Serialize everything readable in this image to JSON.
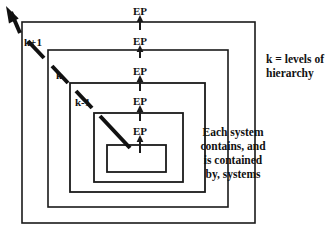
{
  "diagram": {
    "type": "nested-hierarchy-diagram",
    "canvas": {
      "width": 334,
      "height": 236,
      "background": "#ffffff"
    },
    "stroke_color": "#1a1a1a",
    "nested_rectangles": [
      {
        "level": "k+1",
        "x": 22,
        "y": 22,
        "width": 233,
        "height": 201,
        "stroke_width": 1.6
      },
      {
        "level": "k",
        "x": 48,
        "y": 50,
        "width": 180,
        "height": 157,
        "stroke_width": 1.6
      },
      {
        "level": "k-1",
        "x": 70,
        "y": 83,
        "width": 135,
        "height": 109,
        "stroke_width": 1.8
      },
      {
        "level": "",
        "x": 94,
        "y": 113,
        "width": 89,
        "height": 69,
        "stroke_width": 1.8
      },
      {
        "level": "",
        "x": 107,
        "y": 145,
        "width": 59,
        "height": 27,
        "stroke_width": 1.8
      }
    ],
    "ep_markers": [
      {
        "label": "EP",
        "x": 140,
        "y": 11,
        "arrow_from_y": 30,
        "arrow_to_y": 15
      },
      {
        "label": "EP",
        "x": 140,
        "y": 41,
        "arrow_from_y": 58,
        "arrow_to_y": 45
      },
      {
        "label": "EP",
        "x": 140,
        "y": 71,
        "arrow_from_y": 91,
        "arrow_to_y": 75
      },
      {
        "label": "EP",
        "x": 140,
        "y": 101,
        "arrow_from_y": 121,
        "arrow_to_y": 105
      },
      {
        "label": "EP",
        "x": 140,
        "y": 131,
        "arrow_from_y": 153,
        "arrow_to_y": 135
      }
    ],
    "diagonal_arrow": {
      "description": "dashed diagonal arrow pointing up-left through hierarchy levels",
      "tip_x": 6,
      "tip_y": 6,
      "tail_x": 130,
      "tail_y": 148,
      "segments": [
        {
          "x1": 130,
          "y1": 148,
          "x2": 100,
          "y2": 116
        },
        {
          "x1": 92,
          "y1": 108,
          "x2": 76,
          "y2": 91
        },
        {
          "x1": 68,
          "y1": 83,
          "x2": 52,
          "y2": 66
        },
        {
          "x1": 44,
          "y1": 58,
          "x2": 28,
          "y2": 41
        },
        {
          "x1": 20,
          "y1": 33,
          "x2": 11,
          "y2": 12
        }
      ]
    },
    "level_labels": [
      {
        "text": "k+1",
        "x": 24,
        "y": 46
      },
      {
        "text": "k",
        "x": 56,
        "y": 79
      },
      {
        "text": "k-1",
        "x": 75,
        "y": 106
      }
    ],
    "notes": [
      {
        "id": "legend-note",
        "align": "left",
        "x": 266,
        "y": 63,
        "lines": [
          "k = levels of",
          "hierarchy"
        ]
      },
      {
        "id": "containment-note",
        "align": "center",
        "x": 233,
        "y": 136,
        "lines": [
          "Each system",
          "contains, and",
          "is contained",
          "by, systems"
        ]
      }
    ]
  }
}
